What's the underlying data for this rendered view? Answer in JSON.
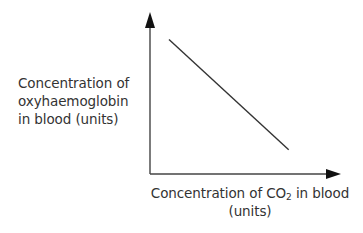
{
  "chart_data": {
    "type": "line",
    "title": "",
    "xlabel": "Concentration of CO2 in blood (units)",
    "ylabel": "Concentration of oxyhaemoglobin in blood (units)",
    "x_ticks": [],
    "y_ticks": [],
    "grid": false,
    "legend": null,
    "series": [
      {
        "name": "oxyhaemoglobin vs CO2",
        "description": "straight line with negative slope; oxyhaemoglobin concentration decreases as CO2 concentration increases",
        "points": [
          {
            "x": 0.1,
            "y": 0.83
          },
          {
            "x": 0.73,
            "y": 0.15
          }
        ]
      }
    ],
    "xlim": [
      0,
      1
    ],
    "ylim": [
      0,
      1
    ],
    "units": "arbitrary (no scale shown)"
  },
  "labels": {
    "y_axis": {
      "line1": "Concentration of",
      "line2": "oxyhaemoglobin",
      "line3": "in blood (units)"
    },
    "x_axis": {
      "prefix": "Concentration of CO",
      "subscript": "2",
      "suffix": " in blood",
      "line2": "(units)"
    }
  },
  "colors": {
    "axis": "#222222",
    "line": "#333333",
    "text": "#333333",
    "background": "#ffffff"
  }
}
